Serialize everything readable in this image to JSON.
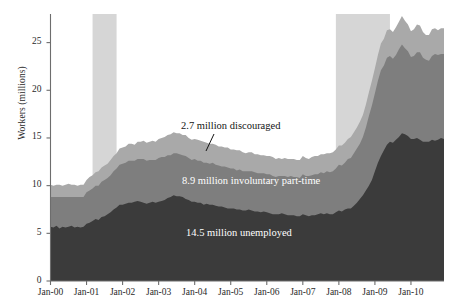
{
  "chart_data": {
    "type": "area",
    "stacked": true,
    "title": "",
    "xlabel": "",
    "ylabel": "Workers (millions)",
    "ylim": [
      0,
      28
    ],
    "yticks": [
      0,
      5,
      10,
      15,
      20,
      25
    ],
    "ytick_labels": [
      "0",
      "5",
      "10",
      "15",
      "20",
      "25"
    ],
    "xtick_labels": [
      "Jan-00",
      "Jan-01",
      "Jan-02",
      "Jan-03",
      "Jan-04",
      "Jan-05",
      "Jan-06",
      "Jan-07",
      "Jan-08",
      "Jan-09",
      "Jan-10"
    ],
    "xlim": [
      "Jan-00",
      "Jan-11"
    ],
    "grid": false,
    "legend": "none",
    "colors": {
      "unemployed": "#3b3b3b",
      "involuntary_part_time": "#7e7e7e",
      "discouraged": "#a9a9a9",
      "recession_band": "#d6d6d6",
      "axis": "#6d6d6d",
      "background": "#ffffff"
    },
    "annotations": [
      {
        "name": "discouraged",
        "text": "2.7 million discouraged",
        "value": 2.7,
        "units": "million"
      },
      {
        "name": "involuntary-part-time",
        "text": "8.9 million involuntary part-time",
        "value": 8.9,
        "units": "million"
      },
      {
        "name": "unemployed",
        "text": "14.5 million unemployed",
        "value": 14.5,
        "units": "million"
      }
    ],
    "recession_bands": [
      {
        "start": "Mar-01",
        "end": "Nov-01"
      },
      {
        "start": "Dec-07",
        "end": "Jun-09"
      }
    ],
    "series": [
      {
        "name": "14.5 million unemployed",
        "key": "unemployed",
        "color": "#3b3b3b",
        "values": [
          5.7,
          5.6,
          5.8,
          5.5,
          5.7,
          5.6,
          5.7,
          5.8,
          5.6,
          5.7,
          5.6,
          5.7,
          6.0,
          6.1,
          6.3,
          6.5,
          6.4,
          6.7,
          6.8,
          7.0,
          7.2,
          7.5,
          7.7,
          8.0,
          8.0,
          8.1,
          8.2,
          8.2,
          8.3,
          8.4,
          8.3,
          8.2,
          8.1,
          8.2,
          8.3,
          8.2,
          8.3,
          8.4,
          8.5,
          8.7,
          8.8,
          9.0,
          8.9,
          8.9,
          8.8,
          8.6,
          8.5,
          8.3,
          8.3,
          8.2,
          8.2,
          8.0,
          8.1,
          8.0,
          8.0,
          7.9,
          7.8,
          7.8,
          7.7,
          7.6,
          7.6,
          7.6,
          7.5,
          7.5,
          7.4,
          7.4,
          7.5,
          7.4,
          7.3,
          7.3,
          7.2,
          7.3,
          7.2,
          7.1,
          7.0,
          7.0,
          7.0,
          7.1,
          7.0,
          6.9,
          6.9,
          6.9,
          6.8,
          6.8,
          7.0,
          6.9,
          6.8,
          6.9,
          6.9,
          7.0,
          7.1,
          7.0,
          7.1,
          7.0,
          7.0,
          7.2,
          7.4,
          7.3,
          7.5,
          7.6,
          7.6,
          7.9,
          8.2,
          8.6,
          9.0,
          9.5,
          10.0,
          10.6,
          11.5,
          12.4,
          13.1,
          13.7,
          14.3,
          14.6,
          14.5,
          14.8,
          15.1,
          15.5,
          15.4,
          15.2,
          14.9,
          14.9,
          15.0,
          14.8,
          14.6,
          14.6,
          14.6,
          14.8,
          14.7,
          14.8,
          15.0,
          14.9
        ]
      },
      {
        "name": "8.9 million involuntary part-time",
        "key": "involuntary_part_time",
        "color": "#7e7e7e",
        "values": [
          3.1,
          3.2,
          3.0,
          3.3,
          3.1,
          3.2,
          3.1,
          3.0,
          3.2,
          3.1,
          3.2,
          3.1,
          3.3,
          3.4,
          3.4,
          3.5,
          3.6,
          3.7,
          3.8,
          3.8,
          3.9,
          4.0,
          4.1,
          4.2,
          4.3,
          4.3,
          4.4,
          4.4,
          4.3,
          4.4,
          4.5,
          4.6,
          4.5,
          4.5,
          4.4,
          4.5,
          4.6,
          4.6,
          4.5,
          4.5,
          4.4,
          4.4,
          4.5,
          4.4,
          4.4,
          4.5,
          4.4,
          4.4,
          4.5,
          4.4,
          4.4,
          4.4,
          4.3,
          4.3,
          4.4,
          4.3,
          4.3,
          4.2,
          4.3,
          4.3,
          4.2,
          4.2,
          4.1,
          4.2,
          4.1,
          4.1,
          4.0,
          4.1,
          4.1,
          4.0,
          4.1,
          4.0,
          4.0,
          4.1,
          4.0,
          3.9,
          4.0,
          3.9,
          4.0,
          4.0,
          4.1,
          4.0,
          4.1,
          4.0,
          4.2,
          4.1,
          4.2,
          4.2,
          4.3,
          4.2,
          4.3,
          4.3,
          4.4,
          4.4,
          4.5,
          4.6,
          4.8,
          4.8,
          4.9,
          5.2,
          5.3,
          5.5,
          5.7,
          5.8,
          6.1,
          6.6,
          7.3,
          7.8,
          8.2,
          8.6,
          9.0,
          8.9,
          9.1,
          9.0,
          8.8,
          8.9,
          9.2,
          9.3,
          9.0,
          8.9,
          8.6,
          8.7,
          9.0,
          9.2,
          8.8,
          8.6,
          8.5,
          8.8,
          9.1,
          8.9,
          8.8,
          8.9
        ]
      },
      {
        "name": "2.7 million discouraged",
        "key": "discouraged",
        "color": "#a9a9a9",
        "values": [
          1.3,
          1.2,
          1.3,
          1.3,
          1.2,
          1.3,
          1.4,
          1.3,
          1.3,
          1.2,
          1.3,
          1.3,
          1.3,
          1.4,
          1.4,
          1.4,
          1.5,
          1.5,
          1.5,
          1.5,
          1.6,
          1.6,
          1.6,
          1.7,
          1.7,
          1.7,
          1.8,
          1.8,
          1.7,
          1.8,
          1.8,
          1.9,
          1.9,
          1.9,
          2.0,
          1.9,
          2.0,
          2.0,
          2.1,
          2.1,
          2.2,
          2.2,
          2.1,
          2.2,
          2.1,
          2.2,
          2.1,
          2.1,
          2.1,
          2.2,
          2.1,
          2.2,
          2.1,
          2.1,
          2.0,
          2.1,
          2.0,
          2.1,
          2.0,
          2.1,
          2.0,
          2.0,
          2.1,
          2.0,
          2.0,
          1.9,
          2.0,
          2.0,
          1.9,
          2.0,
          1.9,
          1.9,
          1.9,
          1.9,
          2.0,
          1.9,
          1.9,
          1.8,
          1.9,
          1.9,
          1.8,
          1.9,
          1.8,
          1.9,
          1.9,
          1.9,
          1.8,
          1.9,
          1.9,
          1.9,
          1.9,
          2.0,
          1.9,
          2.0,
          2.0,
          2.0,
          2.0,
          2.1,
          2.1,
          2.1,
          2.2,
          2.2,
          2.2,
          2.3,
          2.3,
          2.4,
          2.5,
          2.6,
          2.6,
          2.7,
          2.8,
          2.8,
          2.9,
          2.8,
          2.8,
          2.9,
          2.9,
          3.0,
          2.9,
          2.8,
          2.7,
          2.8,
          2.9,
          2.8,
          2.7,
          2.6,
          2.7,
          2.8,
          2.7,
          2.6,
          2.7,
          2.7
        ]
      }
    ]
  }
}
